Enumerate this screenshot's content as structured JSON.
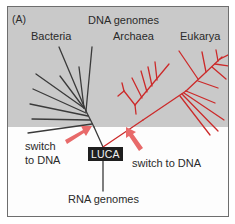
{
  "figure": {
    "panel_label": "(A)",
    "top_title": "DNA genomes",
    "groups": [
      {
        "name": "Bacteria",
        "color": "#3a3a3a"
      },
      {
        "name": "Archaea",
        "color": "#cc2a2a"
      },
      {
        "name": "Eukarya",
        "color": "#cc2a2a"
      }
    ],
    "root_node": "LUCA",
    "bottom_label": "RNA genomes",
    "annotations": [
      {
        "id": "left",
        "text_line1": "switch",
        "text_line2": "to DNA"
      },
      {
        "id": "right",
        "text": "switch to DNA"
      }
    ],
    "colors": {
      "dna_region_bg": "#c9c9c9",
      "rna_region_bg": "#fdfdfd",
      "bacteria_branch": "#3a3a3a",
      "archaea_eukarya_branch": "#cc2a2a",
      "arrow": "#e86a6a",
      "luca_bg": "#1e1e1e"
    }
  }
}
